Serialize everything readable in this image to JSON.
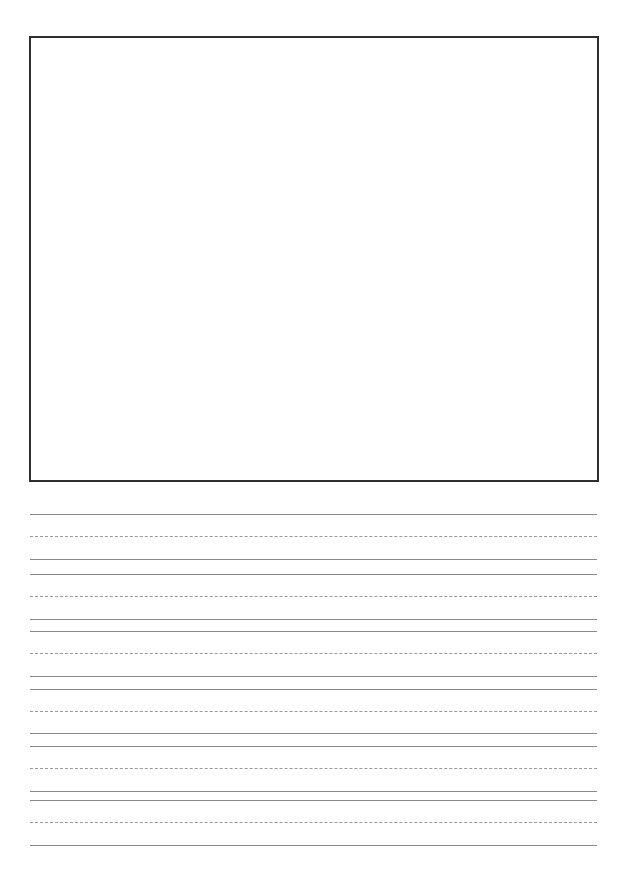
{
  "page": {
    "type": "handwriting practice sheet",
    "drawing_box": {
      "label": ""
    },
    "writing_lines": [
      {
        "y": 514,
        "style": "solid"
      },
      {
        "y": 536,
        "style": "dashed"
      },
      {
        "y": 559,
        "style": "solid"
      },
      {
        "y": 574,
        "style": "solid"
      },
      {
        "y": 596,
        "style": "dashed"
      },
      {
        "y": 619,
        "style": "solid"
      },
      {
        "y": 631,
        "style": "solid"
      },
      {
        "y": 653,
        "style": "dashed"
      },
      {
        "y": 676,
        "style": "solid"
      },
      {
        "y": 689,
        "style": "solid"
      },
      {
        "y": 711,
        "style": "dashed"
      },
      {
        "y": 733,
        "style": "solid"
      },
      {
        "y": 746,
        "style": "solid"
      },
      {
        "y": 768,
        "style": "dashed"
      },
      {
        "y": 791,
        "style": "solid"
      },
      {
        "y": 800,
        "style": "solid"
      },
      {
        "y": 822,
        "style": "dashed"
      },
      {
        "y": 845,
        "style": "solid"
      }
    ],
    "colors": {
      "box_border": "#2e2e2e",
      "solid_line": "#8a8a8a",
      "dashed_line": "#9a9a9a"
    }
  }
}
